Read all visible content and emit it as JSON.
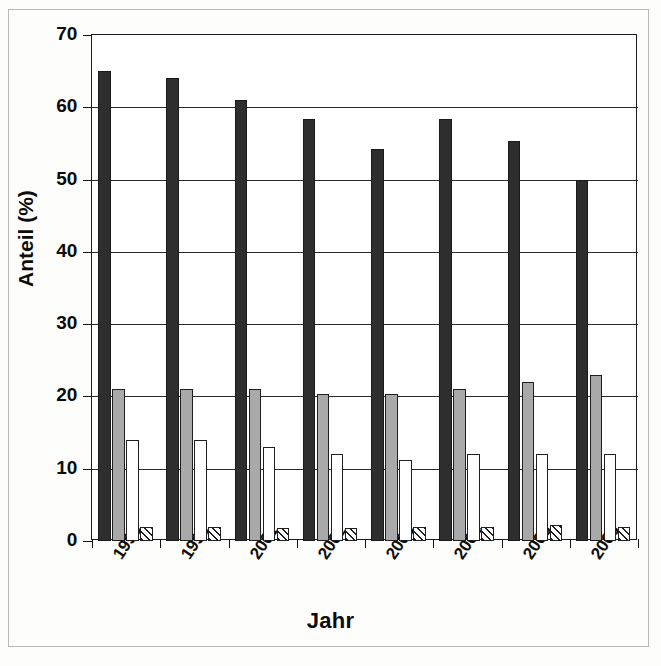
{
  "chart_data": {
    "type": "bar",
    "title": "",
    "subtitle": "",
    "xlabel": "Jahr",
    "ylabel": "Anteil (%)",
    "ylim": [
      0,
      70
    ],
    "ytick_values": [
      0,
      10,
      20,
      30,
      40,
      50,
      60,
      70
    ],
    "ytick_labels": [
      "0",
      "10",
      "20",
      "30",
      "40",
      "50",
      "60",
      "70"
    ],
    "grid": "horizontal",
    "legend_position": "none",
    "categories": [
      "1998",
      "1999",
      "2001",
      "2002",
      "2003",
      "2004",
      "2005",
      "2006"
    ],
    "series": [
      {
        "name": "series-1-black",
        "color": "#2e2e2e",
        "fill": "solid-black",
        "values": [
          65,
          64,
          61,
          58.4,
          54.2,
          58.4,
          55.4,
          50
        ]
      },
      {
        "name": "series-2-gray",
        "color": "#a9a9a9",
        "fill": "solid-gray",
        "values": [
          21,
          21,
          21,
          20.3,
          20.3,
          21,
          22,
          23
        ]
      },
      {
        "name": "series-3-white",
        "color": "#ffffff",
        "fill": "solid-white",
        "values": [
          14,
          14,
          13,
          12,
          11.2,
          12,
          12,
          12
        ]
      },
      {
        "name": "series-4-hatched",
        "color": "#ffffff",
        "fill": "diagonal-hatch",
        "values": [
          2,
          2,
          1.8,
          1.8,
          2,
          2,
          2.2,
          2
        ]
      }
    ]
  },
  "axes": {
    "y_title": "Anteil (%)",
    "x_title": "Jahr"
  }
}
